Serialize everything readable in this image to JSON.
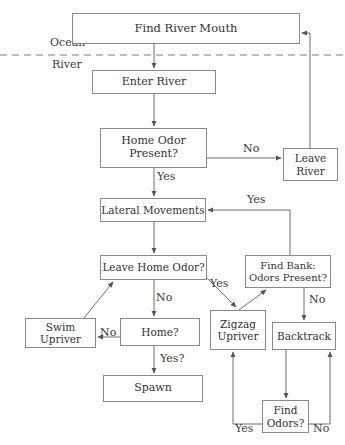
{
  "diagram": {
    "style": {
      "box_border_color": "#8a8a8a",
      "line_color": "#6f6f6f",
      "text_color": "#333333",
      "background": "#ffffff"
    },
    "region_labels": [
      {
        "id": "ocean",
        "text": "Ocean",
        "x": 50,
        "y": 42,
        "size": 11
      },
      {
        "id": "river",
        "text": "River",
        "x": 52,
        "y": 58,
        "size": 11
      }
    ],
    "divider": {
      "name": "ocean-river-boundary",
      "style": "dashed",
      "y": 55,
      "x1": 0,
      "x2": 345
    },
    "nodes": [
      {
        "id": "find_river_mouth",
        "text": "Find River Mouth",
        "x": 72,
        "y": 13,
        "w": 228,
        "h": 31,
        "size": 11.5
      },
      {
        "id": "enter_river",
        "text": "Enter River",
        "x": 92,
        "y": 70,
        "w": 124,
        "h": 24,
        "size": 11
      },
      {
        "id": "home_odor_present",
        "text": "Home Odor\nPresent?",
        "x": 100,
        "y": 128,
        "w": 107,
        "h": 40,
        "size": 11
      },
      {
        "id": "leave_river",
        "text": "Leave\nRiver",
        "x": 283,
        "y": 148,
        "w": 55,
        "h": 33,
        "size": 10.5
      },
      {
        "id": "lateral_movements",
        "text": "Lateral Movements",
        "x": 100,
        "y": 198,
        "w": 106,
        "h": 24,
        "size": 10.5
      },
      {
        "id": "leave_home_odor",
        "text": "Leave Home Odor?",
        "x": 100,
        "y": 255,
        "w": 107,
        "h": 25,
        "size": 10.5
      },
      {
        "id": "find_bank_odors",
        "text": "Find Bank:\nOdors Present?",
        "x": 245,
        "y": 255,
        "w": 86,
        "h": 33,
        "size": 10
      },
      {
        "id": "swim_upriver",
        "text": "Swim\nUpriver",
        "x": 25,
        "y": 318,
        "w": 71,
        "h": 30,
        "size": 10.5
      },
      {
        "id": "home",
        "text": "Home?",
        "x": 120,
        "y": 318,
        "w": 80,
        "h": 28,
        "size": 10.5
      },
      {
        "id": "zigzag_upriver",
        "text": "Zigzag\nUpriver",
        "x": 210,
        "y": 310,
        "w": 56,
        "h": 40,
        "size": 10.5
      },
      {
        "id": "backtrack",
        "text": "Backtrack",
        "x": 272,
        "y": 322,
        "w": 64,
        "h": 28,
        "size": 10.5
      },
      {
        "id": "spawn",
        "text": "Spawn",
        "x": 103,
        "y": 375,
        "w": 100,
        "h": 27,
        "size": 11
      },
      {
        "id": "find_odors",
        "text": "Find\nOdors?",
        "x": 262,
        "y": 400,
        "w": 47,
        "h": 33,
        "size": 10.5
      }
    ],
    "edge_labels": [
      {
        "id": "home_odor_no",
        "text": "No",
        "x": 243,
        "y": 149,
        "size": 11
      },
      {
        "id": "home_odor_yes",
        "text": "Yes",
        "x": 157,
        "y": 174,
        "size": 11
      },
      {
        "id": "find_bank_yes",
        "text": "Yes",
        "x": 247,
        "y": 198,
        "size": 11
      },
      {
        "id": "leave_home_odor_yes",
        "text": "Yes",
        "x": 212,
        "y": 281,
        "size": 11
      },
      {
        "id": "leave_home_odor_no",
        "text": "No",
        "x": 156,
        "y": 296,
        "size": 11
      },
      {
        "id": "find_bank_no",
        "text": "No",
        "x": 310,
        "y": 298,
        "size": 11
      },
      {
        "id": "home_no",
        "text": "No",
        "x": 100,
        "y": 325,
        "size": 11
      },
      {
        "id": "home_yes",
        "text": "Yes?",
        "x": 160,
        "y": 356,
        "size": 11
      },
      {
        "id": "find_odors_yes",
        "text": "Yes",
        "x": 237,
        "y": 421,
        "size": 11
      },
      {
        "id": "find_odors_no",
        "text": "No",
        "x": 313,
        "y": 421,
        "size": 11
      }
    ],
    "edges": [
      {
        "id": "find_river_mouth-to-enter_river",
        "from": "find_river_mouth",
        "to": "enter_river",
        "label": ""
      },
      {
        "id": "enter_river-to-home_odor_present",
        "from": "enter_river",
        "to": "home_odor_present",
        "label": ""
      },
      {
        "id": "home_odor_present-to-leave_river",
        "from": "home_odor_present",
        "to": "leave_river",
        "label": "No"
      },
      {
        "id": "leave_river-to-find_river_mouth",
        "from": "leave_river",
        "to": "find_river_mouth",
        "label": ""
      },
      {
        "id": "home_odor_present-to-lateral_movements",
        "from": "home_odor_present",
        "to": "lateral_movements",
        "label": "Yes"
      },
      {
        "id": "lateral_movements-to-leave_home_odor",
        "from": "lateral_movements",
        "to": "leave_home_odor",
        "label": ""
      },
      {
        "id": "leave_home_odor-to-zigzag_upriver",
        "from": "leave_home_odor",
        "to": "zigzag_upriver",
        "label": "Yes"
      },
      {
        "id": "leave_home_odor-to-home",
        "from": "leave_home_odor",
        "to": "home",
        "label": "No"
      },
      {
        "id": "home-to-swim_upriver",
        "from": "home",
        "to": "swim_upriver",
        "label": "No"
      },
      {
        "id": "swim_upriver-to-leave_home_odor",
        "from": "swim_upriver",
        "to": "leave_home_odor",
        "label": ""
      },
      {
        "id": "home-to-spawn",
        "from": "home",
        "to": "spawn",
        "label": "Yes?"
      },
      {
        "id": "zigzag_upriver-to-find_bank_odors",
        "from": "zigzag_upriver",
        "to": "find_bank_odors",
        "label": ""
      },
      {
        "id": "find_bank_odors-to-lateral_movements",
        "from": "find_bank_odors",
        "to": "lateral_movements",
        "label": "Yes"
      },
      {
        "id": "find_bank_odors-to-backtrack",
        "from": "find_bank_odors",
        "to": "backtrack",
        "label": "No"
      },
      {
        "id": "backtrack-to-find_odors",
        "from": "backtrack",
        "to": "find_odors",
        "label": ""
      },
      {
        "id": "find_odors-to-zigzag_upriver",
        "from": "find_odors",
        "to": "zigzag_upriver",
        "label": "Yes"
      },
      {
        "id": "find_odors-to-backtrack",
        "from": "find_odors",
        "to": "backtrack",
        "label": "No"
      }
    ]
  }
}
